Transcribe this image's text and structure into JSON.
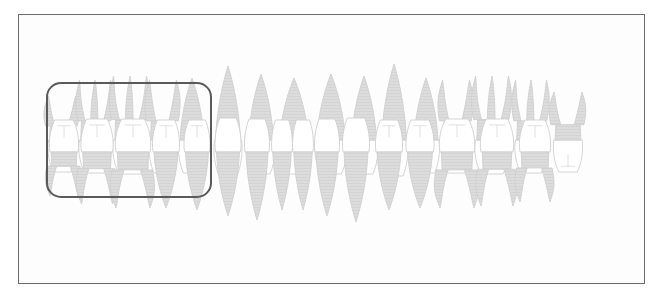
{
  "figure": {
    "kind": "dental-arch-diagram",
    "background_color": "#ffffff",
    "panel_color": "#fdfdfd",
    "frame": {
      "name": "outer-frame",
      "x": 18,
      "y": 14,
      "width": 627,
      "height": 270,
      "stroke_color": "#6b6b6b",
      "stroke_width": 1
    }
  },
  "selection": {
    "name": "selection-rectangle",
    "label": "",
    "x": 47,
    "y": 83,
    "width": 164,
    "height": 114,
    "corner_radius": 14,
    "stroke_color": "#5a5a5a",
    "stroke_width": 2,
    "fill": "none"
  },
  "style": {
    "outline_color": "#cfcfcf",
    "crown_fill": "#ffffff",
    "root_fill": "#dcdcdc",
    "root_fill_dark": "#d2d2d2",
    "detail_line": "#d8d8d8",
    "outline_width": 0.9
  },
  "arches": [
    {
      "name": "upper-arch",
      "position": "maxillary",
      "orientation": "roots-up",
      "baseline_y": 140,
      "tooth_count": 16,
      "teeth": [
        {
          "id": "UR8",
          "type": "molar",
          "cx": 62,
          "crown_w": 27,
          "crown_h": 32,
          "root_h": 44,
          "roots": 2
        },
        {
          "id": "UR7",
          "type": "molar",
          "cx": 95,
          "crown_w": 31,
          "crown_h": 33,
          "root_h": 60,
          "roots": 3
        },
        {
          "id": "UR6",
          "type": "molar",
          "cx": 130,
          "crown_w": 33,
          "crown_h": 34,
          "root_h": 64,
          "roots": 3
        },
        {
          "id": "UR5",
          "type": "premolar",
          "cx": 163,
          "crown_w": 27,
          "crown_h": 33,
          "root_h": 60,
          "roots": 2
        },
        {
          "id": "UR4",
          "type": "premolar",
          "cx": 192,
          "crown_w": 26,
          "crown_h": 33,
          "root_h": 62,
          "roots": 1
        },
        {
          "id": "UR3",
          "type": "canine",
          "cx": 228,
          "crown_w": 27,
          "crown_h": 36,
          "root_h": 74,
          "roots": 1
        },
        {
          "id": "UR2",
          "type": "lateral-incisor",
          "cx": 261,
          "crown_w": 27,
          "crown_h": 34,
          "root_h": 66,
          "roots": 1
        },
        {
          "id": "UR1",
          "type": "central-incisor",
          "cx": 294,
          "crown_w": 31,
          "crown_h": 34,
          "root_h": 62,
          "roots": 1
        },
        {
          "id": "UL1",
          "type": "central-incisor",
          "cx": 331,
          "crown_w": 31,
          "crown_h": 34,
          "root_h": 66,
          "roots": 1
        },
        {
          "id": "UL2",
          "type": "lateral-incisor",
          "cx": 364,
          "crown_w": 27,
          "crown_h": 34,
          "root_h": 64,
          "roots": 1
        },
        {
          "id": "UL3",
          "type": "canine",
          "cx": 394,
          "crown_w": 27,
          "crown_h": 36,
          "root_h": 76,
          "roots": 1
        },
        {
          "id": "UL4",
          "type": "premolar",
          "cx": 426,
          "crown_w": 26,
          "crown_h": 33,
          "root_h": 62,
          "roots": 1
        },
        {
          "id": "UL5",
          "type": "premolar",
          "cx": 456,
          "crown_w": 27,
          "crown_h": 33,
          "root_h": 60,
          "roots": 2
        },
        {
          "id": "UL6",
          "type": "molar",
          "cx": 492,
          "crown_w": 33,
          "crown_h": 34,
          "root_h": 64,
          "roots": 3
        },
        {
          "id": "UL7",
          "type": "molar",
          "cx": 531,
          "crown_w": 31,
          "crown_h": 33,
          "root_h": 60,
          "roots": 3
        },
        {
          "id": "UL8",
          "type": "molar",
          "cx": 568,
          "crown_w": 28,
          "crown_h": 32,
          "root_h": 48,
          "roots": 2
        }
      ]
    },
    {
      "name": "lower-arch",
      "position": "mandibular",
      "orientation": "roots-down",
      "baseline_y": 152,
      "tooth_count": 16,
      "teeth": [
        {
          "id": "LR8",
          "type": "molar",
          "cx": 64,
          "crown_w": 28,
          "crown_h": 32,
          "root_h": 44,
          "roots": 2
        },
        {
          "id": "LR7",
          "type": "molar",
          "cx": 97,
          "crown_w": 31,
          "crown_h": 33,
          "root_h": 52,
          "roots": 2
        },
        {
          "id": "LR6",
          "type": "molar",
          "cx": 133,
          "crown_w": 34,
          "crown_h": 33,
          "root_h": 56,
          "roots": 2
        },
        {
          "id": "LR5",
          "type": "premolar",
          "cx": 166,
          "crown_w": 26,
          "crown_h": 32,
          "root_h": 56,
          "roots": 1
        },
        {
          "id": "LR4",
          "type": "premolar",
          "cx": 197,
          "crown_w": 25,
          "crown_h": 32,
          "root_h": 58,
          "roots": 1
        },
        {
          "id": "LR3",
          "type": "canine",
          "cx": 228,
          "crown_w": 25,
          "crown_h": 34,
          "root_h": 64,
          "roots": 1
        },
        {
          "id": "LR2",
          "type": "lateral-incisor",
          "cx": 257,
          "crown_w": 24,
          "crown_h": 33,
          "root_h": 68,
          "roots": 1
        },
        {
          "id": "LR1",
          "type": "central-incisor",
          "cx": 282,
          "crown_w": 20,
          "crown_h": 32,
          "root_h": 58,
          "roots": 1
        },
        {
          "id": "LL1",
          "type": "central-incisor",
          "cx": 303,
          "crown_w": 20,
          "crown_h": 32,
          "root_h": 58,
          "roots": 1
        },
        {
          "id": "LL2",
          "type": "lateral-incisor",
          "cx": 327,
          "crown_w": 24,
          "crown_h": 33,
          "root_h": 64,
          "roots": 1
        },
        {
          "id": "LL3",
          "type": "canine",
          "cx": 356,
          "crown_w": 26,
          "crown_h": 34,
          "root_h": 70,
          "roots": 1
        },
        {
          "id": "LL4",
          "type": "premolar",
          "cx": 389,
          "crown_w": 26,
          "crown_h": 32,
          "root_h": 58,
          "roots": 1
        },
        {
          "id": "LL5",
          "type": "premolar",
          "cx": 420,
          "crown_w": 27,
          "crown_h": 32,
          "root_h": 56,
          "roots": 1
        },
        {
          "id": "LL6",
          "type": "molar",
          "cx": 457,
          "crown_w": 34,
          "crown_h": 33,
          "root_h": 56,
          "roots": 2
        },
        {
          "id": "LL7",
          "type": "molar",
          "cx": 497,
          "crown_w": 32,
          "crown_h": 33,
          "root_h": 54,
          "roots": 2
        },
        {
          "id": "LL8",
          "type": "molar",
          "cx": 535,
          "crown_w": 30,
          "crown_h": 32,
          "root_h": 50,
          "roots": 2
        }
      ]
    }
  ]
}
